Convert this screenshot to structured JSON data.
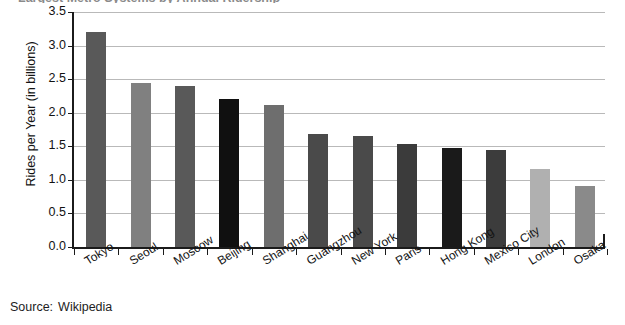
{
  "figure": {
    "title_sliver": "Largest Metro Systems by Annual Ridership",
    "source_prefix": "Source:",
    "source_value": "Wikipedia"
  },
  "chart_data": {
    "type": "bar",
    "title": "",
    "xlabel": "",
    "ylabel": "Rides per Year (in billions)",
    "ylim": [
      0.0,
      3.5
    ],
    "ytick_labels": [
      "0.0",
      "0.5",
      "1.0",
      "1.5",
      "2.0",
      "2.5",
      "3.0",
      "3.5"
    ],
    "ytick_values": [
      0.0,
      0.5,
      1.0,
      1.5,
      2.0,
      2.5,
      3.0,
      3.5
    ],
    "grid": true,
    "legend": false,
    "categories": [
      "Tokyo",
      "Seoul",
      "Moscow",
      "Beijing",
      "Shanghai",
      "Guangzhou",
      "New York",
      "Paris",
      "Hong Kong",
      "Mexico City",
      "London",
      "Osaka"
    ],
    "values": [
      3.2,
      2.44,
      2.4,
      2.2,
      2.12,
      1.68,
      1.65,
      1.53,
      1.48,
      1.45,
      1.16,
      0.91
    ],
    "bar_colors": [
      "#595959",
      "#808080",
      "#595959",
      "#101010",
      "#6e6e6e",
      "#4a4a4a",
      "#4a4a4a",
      "#3b3b3b",
      "#1a1a1a",
      "#3c3c3c",
      "#b0b0b0",
      "#8a8a8a"
    ]
  },
  "colors": {
    "axis": "#1b1b1b",
    "gridline": "#b9b9b9",
    "background": "#ffffff",
    "text": "#131313"
  }
}
